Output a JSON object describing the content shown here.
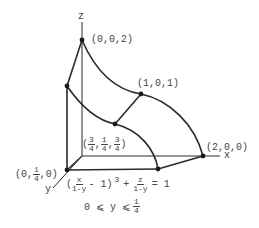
{
  "axes": {
    "x": "x",
    "y": "y",
    "z": "z"
  },
  "points": {
    "p002": "(0,0,2)",
    "p101": "(1,0,1)",
    "p200": "(2,0,0)",
    "p0q0": {
      "open": "(0,",
      "num": "1",
      "den": "4",
      "close": ",0)"
    },
    "pmid": {
      "open": "(",
      "a_num": "3",
      "a_den": "4",
      "b_num": "1",
      "b_den": "4",
      "c_num": "3",
      "c_den": "4",
      "close": ")"
    }
  },
  "equation": {
    "open": "(",
    "f1_num": "x",
    "f1_den": "1-y",
    "mid": "- 1)",
    "exp": "3",
    "plus": "+",
    "f2_num": "z",
    "f2_den": "1-y",
    "rhs": "= 1"
  },
  "constraint": {
    "left": "0 ⩽ y ⩽",
    "num": "1",
    "den": "4"
  },
  "colors": {
    "line": "#2a2a2a",
    "text": "#444444"
  }
}
